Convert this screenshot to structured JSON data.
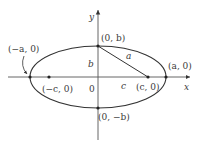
{
  "figure": {
    "axes": {
      "x_label": "x",
      "y_label": "y",
      "origin_label": "0"
    },
    "points": {
      "left_vertex": "(−a, 0)",
      "right_vertex": "(a, 0)",
      "top_vertex": "(0, b)",
      "bottom_vertex": "(0, −b)",
      "left_focus": "(−c, 0)",
      "right_focus": "(c, 0)"
    },
    "segments": {
      "semi_minor": "b",
      "focal_distance": "c",
      "hypotenuse": "a"
    },
    "colors": {
      "stroke": "#333333",
      "text": "#3a3a3a",
      "background": "#ffffff"
    }
  }
}
